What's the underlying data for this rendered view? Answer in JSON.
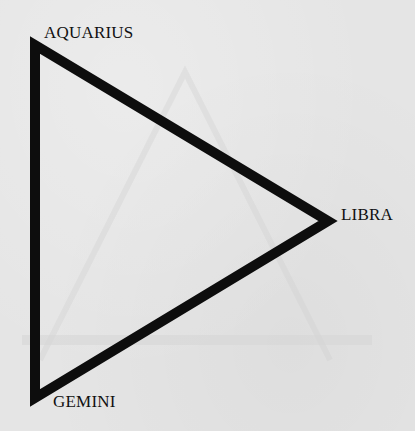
{
  "diagram": {
    "type": "triangle",
    "colors": {
      "background": "#e5e5e5",
      "stroke": "#0d0d0d",
      "label": "#111111",
      "ghost": "#d2d2d2"
    },
    "vertices": [
      {
        "id": "aquarius",
        "label": "AQUARIUS",
        "position": "top-left"
      },
      {
        "id": "libra",
        "label": "LIBRA",
        "position": "right"
      },
      {
        "id": "gemini",
        "label": "GEMINI",
        "position": "bottom-left"
      }
    ]
  }
}
